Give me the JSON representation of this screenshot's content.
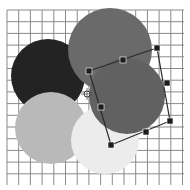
{
  "canvas": {
    "width": 190,
    "height": 190,
    "background": "#ffffff",
    "grid": {
      "x0": 7,
      "y0": 10,
      "x1": 184,
      "y1": 185,
      "spacing": 11.7,
      "color": "#8a8a8a"
    }
  },
  "shapes": [
    {
      "name": "circle-dark",
      "cx": 48,
      "cy": 76,
      "r": 37,
      "fill": "#232323"
    },
    {
      "name": "circle-light-gray",
      "cx": 51,
      "cy": 128,
      "r": 36,
      "fill": "#b9b9b9"
    },
    {
      "name": "circle-very-light",
      "cx": 105,
      "cy": 140,
      "r": 34,
      "fill": "#ececec"
    },
    {
      "name": "circle-mid-gray",
      "cx": 110,
      "cy": 50,
      "r": 42,
      "fill": "#6a6a6a"
    },
    {
      "name": "circle-selected",
      "cx": 127,
      "cy": 96,
      "r": 38,
      "fill": "#616161"
    }
  ],
  "selection": {
    "corners": [
      [
        89,
        71
      ],
      [
        157,
        48
      ],
      [
        170,
        121
      ],
      [
        111,
        145
      ]
    ],
    "edge_handles": [
      [
        123,
        60
      ],
      [
        167,
        83
      ],
      [
        146,
        132
      ],
      [
        101,
        107
      ]
    ],
    "handle_color": "#1c1c1c",
    "line_color": "#2a2a2a",
    "pivot": {
      "x": 87,
      "y": 94,
      "r": 3
    }
  }
}
